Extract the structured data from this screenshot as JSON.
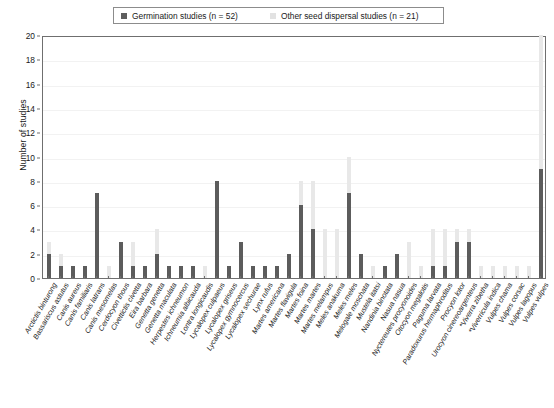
{
  "legend": {
    "entries": [
      {
        "label": "Germination studies (n = 52)",
        "swatch": "dark",
        "color": "#5e5e5e"
      },
      {
        "label": "Other seed dispersal studies (n = 21)",
        "swatch": "light",
        "color": "#e2e2e2"
      }
    ]
  },
  "axis": {
    "y_title": "Number of studies",
    "y_ticks": [
      "0",
      "2",
      "4",
      "6",
      "8",
      "10",
      "12",
      "14",
      "16",
      "18",
      "20"
    ]
  },
  "chart_data": {
    "type": "bar",
    "title": "",
    "xlabel": "",
    "ylabel": "Number of studies",
    "ylim": [
      0,
      20
    ],
    "ytick_step": 2,
    "grid": true,
    "legend_position": "top-center",
    "orientation": "vertical",
    "bar_mode": "overlaid",
    "categories": [
      "Arctictis binturong",
      "Bassariscus astutus",
      "Canis aureus",
      "Canis familiaris",
      "Canis latrans",
      "Canis mesomelas",
      "Cerdocyon thous",
      "Civettictis civetta",
      "Eira barbara",
      "Genetta genetta",
      "Genetta maculata",
      "Herpestes ichneumon",
      "Ichneumia albicauda",
      "Lontra longicaudis",
      "Lycalopex culpaeus",
      "Lycalopex griseus",
      "Lycalopex gymnocercus",
      "Lycalopex sechurae",
      "Lynx rufus",
      "Martes americana",
      "Martes flavigula",
      "Martes foina",
      "Martes martes",
      "Martes melampus",
      "Meles anakuma",
      "Meles meles",
      "Melogale moschata",
      "Mustela itatsi",
      "Nandinia binotata",
      "Nasua nasua",
      "Nyctereutes procyonoides",
      "Otocyon megalotis",
      "Paguma larvata",
      "Paradoxurus hermaphroditus",
      "Procyon lotor",
      "Urocyon cinereoargenteus",
      "*Viverra zibetha",
      "*Viverricula indica",
      "Vulpes chama",
      "Vulpes corsac",
      "Vulpes lagopus",
      "Vulpes vulpes"
    ],
    "series": [
      {
        "name": "Germination studies (n = 52)",
        "color": "#5c5c5c",
        "values": [
          2,
          1,
          1,
          1,
          7,
          0,
          3,
          1,
          1,
          2,
          1,
          1,
          1,
          0,
          8,
          1,
          3,
          1,
          1,
          1,
          2,
          6,
          4,
          0,
          0,
          7,
          2,
          0,
          1,
          2,
          0,
          0,
          1,
          1,
          3,
          3,
          0,
          0,
          0,
          0,
          0,
          9
        ]
      },
      {
        "name": "Other seed dispersal studies (n = 21)",
        "color": "#e8e8e8",
        "values": [
          3,
          2,
          1,
          1,
          7,
          1,
          3,
          3,
          1,
          4,
          1,
          1,
          1,
          1,
          8,
          1,
          3,
          1,
          1,
          1,
          2,
          8,
          8,
          4,
          4,
          10,
          2,
          1,
          1,
          2,
          3,
          1,
          4,
          4,
          4,
          4,
          1,
          1,
          1,
          1,
          1,
          20
        ]
      }
    ]
  }
}
